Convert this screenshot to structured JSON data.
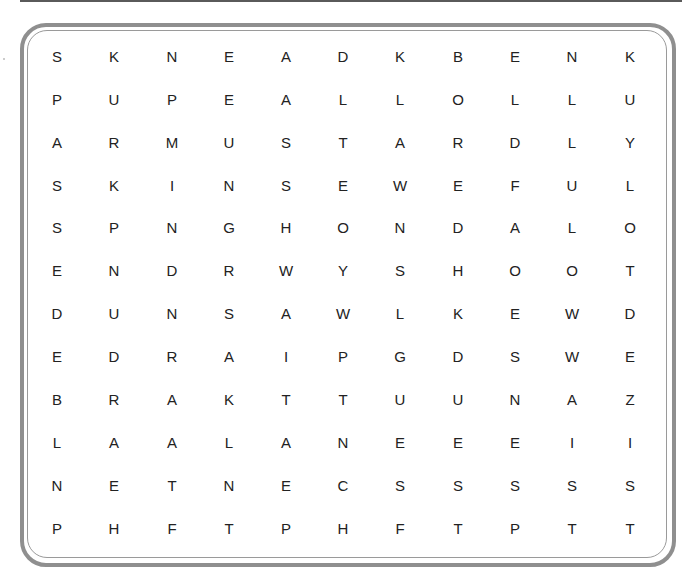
{
  "puzzle": {
    "type": "word-search",
    "rows": 12,
    "cols": 11,
    "grid": [
      [
        "S",
        "K",
        "N",
        "E",
        "A",
        "D",
        "K",
        "B",
        "E",
        "N",
        "K"
      ],
      [
        "P",
        "U",
        "P",
        "E",
        "A",
        "L",
        "L",
        "O",
        "L",
        "L",
        "U"
      ],
      [
        "A",
        "R",
        "M",
        "U",
        "S",
        "T",
        "A",
        "R",
        "D",
        "L",
        "Y"
      ],
      [
        "S",
        "K",
        "I",
        "N",
        "S",
        "E",
        "W",
        "E",
        "F",
        "U",
        "L"
      ],
      [
        "S",
        "P",
        "N",
        "G",
        "H",
        "O",
        "N",
        "D",
        "A",
        "L",
        "O"
      ],
      [
        "E",
        "N",
        "D",
        "R",
        "W",
        "Y",
        "S",
        "H",
        "O",
        "O",
        "T"
      ],
      [
        "D",
        "U",
        "N",
        "S",
        "A",
        "W",
        "L",
        "K",
        "E",
        "W",
        "D"
      ],
      [
        "E",
        "D",
        "R",
        "A",
        "I",
        "P",
        "G",
        "D",
        "S",
        "W",
        "E"
      ],
      [
        "B",
        "R",
        "A",
        "K",
        "T",
        "T",
        "U",
        "U",
        "N",
        "A",
        "Z"
      ],
      [
        "L",
        "A",
        "A",
        "L",
        "A",
        "N",
        "E",
        "E",
        "E",
        "I",
        "I"
      ],
      [
        "N",
        "E",
        "T",
        "N",
        "E",
        "C",
        "S",
        "S",
        "S",
        "S",
        "S"
      ],
      [
        "P",
        "H",
        "F",
        "T",
        "P",
        "H",
        "F",
        "T",
        "P",
        "T",
        "T"
      ]
    ]
  },
  "layout": {
    "col_x": [
      57,
      114,
      172,
      229,
      286,
      343,
      400,
      458,
      515,
      572,
      630
    ],
    "row_y": [
      57,
      100,
      143,
      186,
      228,
      271,
      314,
      357,
      400,
      443,
      486,
      529
    ]
  },
  "colors": {
    "frame": "#8f8f8f",
    "letters": "#222222",
    "background": "#ffffff"
  }
}
